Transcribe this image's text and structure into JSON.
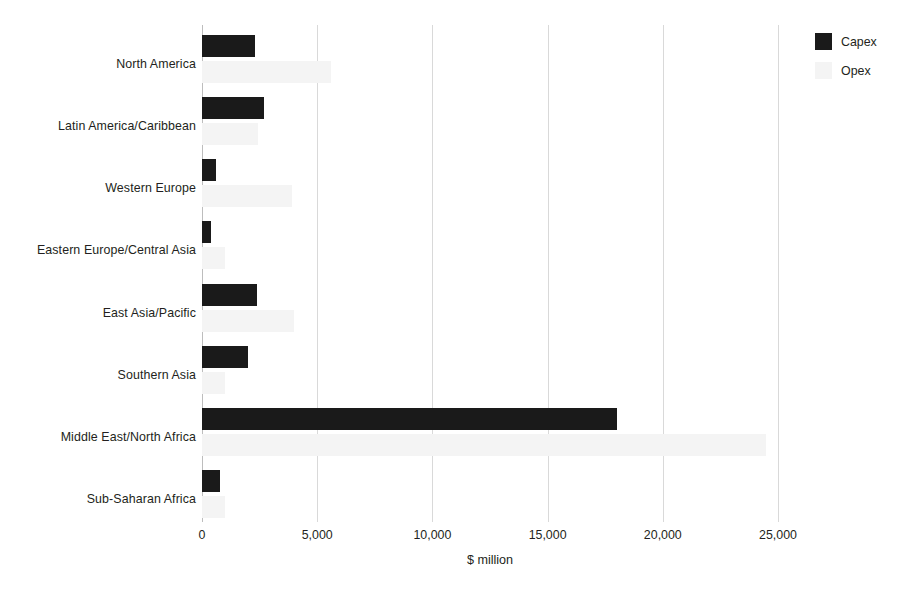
{
  "chart_data": {
    "type": "bar",
    "orientation": "horizontal",
    "title": "",
    "subtitle": "",
    "xlabel": "$ million",
    "ylabel": "",
    "xlim": [
      0,
      25000
    ],
    "xticks": [
      0,
      5000,
      10000,
      15000,
      20000,
      25000
    ],
    "xtick_labels": [
      "0",
      "5,000",
      "10,000",
      "15,000",
      "20,000",
      "25,000"
    ],
    "grid": "vertical",
    "legend_position": "top-right",
    "categories": [
      "North America",
      "Latin America/Caribbean",
      "Western Europe",
      "Eastern Europe/Central Asia",
      "East Asia/Pacific",
      "Southern Asia",
      "Middle East/North Africa",
      "Sub-Saharan Africa"
    ],
    "series": [
      {
        "name": "Capex",
        "color": "#1a1a1a",
        "values": [
          2300,
          2700,
          600,
          400,
          2400,
          2000,
          18000,
          800
        ]
      },
      {
        "name": "Opex",
        "color": "#f4f4f4",
        "values": [
          5600,
          2450,
          3900,
          1000,
          4000,
          1000,
          24500,
          1000
        ]
      }
    ]
  },
  "legend": {
    "items": [
      {
        "label": "Capex",
        "swatch": "capex-swatch"
      },
      {
        "label": "Opex",
        "swatch": "opex-swatch"
      }
    ]
  },
  "colors": {
    "capex": "#1a1a1a",
    "opex": "#f4f4f4",
    "gridline": "#d9d9d9",
    "axis": "#bdbdbd",
    "text": "#231f20",
    "background": "#ffffff"
  }
}
